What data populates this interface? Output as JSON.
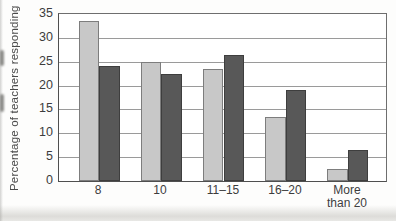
{
  "chart_data": {
    "type": "bar",
    "title": "",
    "xlabel": "",
    "ylabel": "Percentage of teachers responding",
    "ylim": [
      0,
      35
    ],
    "yticks": [
      0,
      5,
      10,
      15,
      20,
      25,
      30,
      35
    ],
    "grid": true,
    "legend": "none",
    "categories": [
      "8",
      "10",
      "11–15",
      "16–20",
      "More than 20"
    ],
    "category_display_lines": [
      [
        "8"
      ],
      [
        "10"
      ],
      [
        "11–15"
      ],
      [
        "16–20"
      ],
      [
        "More",
        "than 20"
      ]
    ],
    "series": [
      {
        "name": "light-gray-series",
        "color": "#c8c8c8",
        "border_color": "#7d7d7d",
        "values": [
          33.5,
          25,
          23.5,
          13.5,
          2.5
        ]
      },
      {
        "name": "dark-gray-series",
        "color": "#585858",
        "border_color": "#3e3e3e",
        "values": [
          24,
          22.5,
          26.5,
          19,
          6.5
        ]
      }
    ]
  }
}
